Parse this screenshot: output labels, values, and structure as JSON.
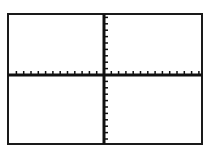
{
  "chart_data": {
    "type": "line",
    "title": "",
    "xlabel": "",
    "ylabel": "",
    "series": [],
    "x_ticks_count_per_side": 13,
    "y_ticks_count_per_side": 10,
    "tick_labels": [],
    "grid": false,
    "legend": null,
    "axes": "cartesian cross-axes with tick marks, no data plotted",
    "frame": {
      "left": 8,
      "top": 14,
      "right": 202,
      "bottom": 144
    },
    "origin": {
      "x": 104,
      "y": 75
    }
  },
  "colors": {
    "background": "#ffffff",
    "axis": "#111111",
    "frame": "#1a1a1a"
  }
}
